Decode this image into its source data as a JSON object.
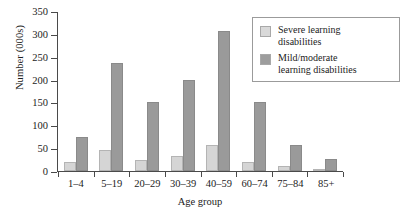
{
  "chart_data": {
    "type": "bar",
    "title": "",
    "xlabel": "Age group",
    "ylabel": "Number (000s)",
    "ylim": [
      0,
      350
    ],
    "ytick_step": 50,
    "yticks": [
      0,
      50,
      100,
      150,
      200,
      250,
      300,
      350
    ],
    "grid": false,
    "legend_position": "top-right",
    "categories": [
      "1–4",
      "5–19",
      "20–29",
      "30–39",
      "40–59",
      "60–74",
      "75–84",
      "85+"
    ],
    "series": [
      {
        "name": "Severe learning disabilities",
        "color": "#d5d5d5",
        "values": [
          20,
          45,
          25,
          32,
          58,
          20,
          10,
          5
        ]
      },
      {
        "name": "Mild/moderate learning disabilities",
        "color": "#9a9a9a",
        "values": [
          75,
          237,
          150,
          200,
          307,
          150,
          58,
          27
        ]
      }
    ]
  },
  "legend": {
    "entries": [
      {
        "label_line1": "Severe learning",
        "label_line2": "disabilities",
        "swatch": "severe-swatch"
      },
      {
        "label_line1": "Mild/moderate",
        "label_line2": "learning disabilities",
        "swatch": "mild-swatch"
      }
    ]
  },
  "colors": {
    "severe": "#d5d5d5",
    "mild": "#9a9a9a",
    "axis": "#4a4a4a",
    "background": "#ffffff",
    "legend_border": "#9b9b9b"
  }
}
